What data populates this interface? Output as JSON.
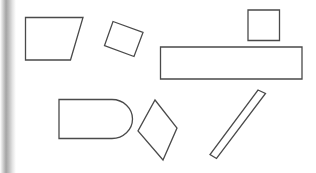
{
  "canvas": {
    "width": 316,
    "height": 173,
    "background_color": "#ffffff",
    "stroke_color": "#4a4a4a",
    "fill_color": "#ffffff",
    "stroke_width": 1.3
  },
  "edge_strip": {
    "name": "left-edge-gradient-strip",
    "x": 0,
    "y": 0,
    "width": 16,
    "height": 173,
    "stops": [
      {
        "offset": "0%",
        "color": "#ffffff"
      },
      {
        "offset": "22%",
        "color": "#c9c9c9"
      },
      {
        "offset": "38%",
        "color": "#a4a4a4"
      },
      {
        "offset": "55%",
        "color": "#bdbdbd"
      },
      {
        "offset": "78%",
        "color": "#e4e4e4"
      },
      {
        "offset": "100%",
        "color": "#ffffff"
      }
    ]
  },
  "shapes": [
    {
      "id": "shape-trapezoid",
      "label": "Trapezoid",
      "kind": "polygon",
      "points": "25.5,17.5 83,17.5 70.5,60 25.5,60"
    },
    {
      "id": "shape-rotated-rectangle",
      "label": "Rotated rectangle",
      "kind": "polygon",
      "points": "113,21.5 143,32.5 134,56.5 104.5,45.5"
    },
    {
      "id": "shape-square",
      "label": "Square",
      "kind": "polygon",
      "points": "248,10 279.5,10 279.5,40.5 248,40.5"
    },
    {
      "id": "shape-long-rectangle",
      "label": "Long rectangle",
      "kind": "polygon",
      "points": "160.5,47 302,47 302,79 160.5,79"
    },
    {
      "id": "shape-rounded-rectangle",
      "label": "Rounded rectangle",
      "kind": "path",
      "d": "M 59,99.5 L 112,99.5 A 20.5,19.5 0 0 1 112,138.5 L 59,138.5 Z"
    },
    {
      "id": "shape-kite",
      "label": "Kite quadrilateral",
      "kind": "polygon",
      "points": "155,100 177,128 163,160 138,131"
    },
    {
      "id": "shape-thin-diagonal-bar",
      "label": "Thin diagonal bar",
      "kind": "polygon",
      "points": "258,90 265.5,93.5 216.5,158.5 210,154.5"
    }
  ]
}
